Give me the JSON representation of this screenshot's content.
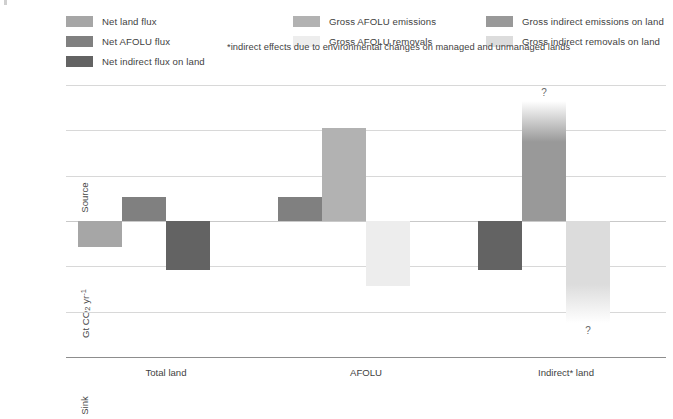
{
  "legend": {
    "items": [
      {
        "label": "Net land flux",
        "color": "#a6a6a6",
        "col": 0,
        "row": 0
      },
      {
        "label": "Net AFOLU flux",
        "color": "#808080",
        "col": 0,
        "row": 1
      },
      {
        "label": "Net indirect flux on land",
        "color": "#636363",
        "col": 0,
        "row": 2
      },
      {
        "label": "Gross AFOLU emissions",
        "color": "#b2b2b2",
        "col": 1,
        "row": 0
      },
      {
        "label": "Gross AFOLU removals",
        "color": "#ededed",
        "col": 1,
        "row": 1
      },
      {
        "label": "Gross indirect emissions on land",
        "color": "#999999",
        "col": 2,
        "row": 0
      },
      {
        "label": "Gross indirect removals on land",
        "color": "#dcdcdc",
        "col": 2,
        "row": 1
      }
    ],
    "footnote": "*indirect effects due to environmental changes on managed and unmanaged lands"
  },
  "axis": {
    "source_label": "Source",
    "sink_label": "Sink",
    "y_title_prefix": "Gt CO",
    "y_title_sub": "2",
    "y_title_mid": " yr",
    "y_title_sup": "-1",
    "tick_labels": [
      "30",
      "20",
      "10",
      "0",
      "–10",
      "–20",
      "–30"
    ],
    "tick_values": [
      30,
      20,
      10,
      0,
      -10,
      -20,
      -30
    ]
  },
  "chart_data": {
    "type": "bar",
    "title": "",
    "xlabel": "",
    "ylabel": "Gt CO2 yr-1",
    "ylim": [
      -30,
      30
    ],
    "grid": true,
    "legend_position": "top",
    "categories": [
      "Total land",
      "AFOLU",
      "Indirect* land"
    ],
    "series": [
      {
        "name": "Net land flux",
        "color": "#a6a6a6",
        "values": [
          -5.8,
          null,
          null
        ]
      },
      {
        "name": "Net AFOLU flux",
        "color": "#808080",
        "values": [
          5.3,
          5.3,
          null
        ]
      },
      {
        "name": "Net indirect flux on land",
        "color": "#636363",
        "values": [
          -10.7,
          null,
          -10.7
        ]
      },
      {
        "name": "Gross AFOLU emissions",
        "color": "#b2b2b2",
        "values": [
          null,
          20.5,
          null
        ]
      },
      {
        "name": "Gross AFOLU removals",
        "color": "#ededed",
        "values": [
          null,
          -14.4,
          null
        ]
      },
      {
        "name": "Gross indirect emissions on land",
        "color": "#999999",
        "values": [
          null,
          null,
          26.5
        ]
      },
      {
        "name": "Gross indirect removals on land",
        "color": "#dcdcdc",
        "values": [
          null,
          null,
          -22.5
        ]
      }
    ],
    "annotations": [
      {
        "text": "?",
        "series": "Gross indirect emissions on land",
        "category": "Indirect* land",
        "position": "above"
      },
      {
        "text": "?",
        "series": "Gross indirect removals on land",
        "category": "Indirect* land",
        "position": "below"
      }
    ],
    "bars": [
      {
        "name": "total-land-net-land-flux",
        "series": 0,
        "group": 0,
        "slot": 0,
        "value": -5.8,
        "fade": "none"
      },
      {
        "name": "total-land-net-afolu-flux",
        "series": 1,
        "group": 0,
        "slot": 1,
        "value": 5.3,
        "fade": "none"
      },
      {
        "name": "total-land-net-indirect-flux",
        "series": 2,
        "group": 0,
        "slot": 2,
        "value": -10.7,
        "fade": "none"
      },
      {
        "name": "afolu-net-afolu-flux",
        "series": 1,
        "group": 1,
        "slot": 0,
        "value": 5.3,
        "fade": "none"
      },
      {
        "name": "afolu-gross-emissions",
        "series": 3,
        "group": 1,
        "slot": 1,
        "value": 20.5,
        "fade": "none"
      },
      {
        "name": "afolu-gross-removals",
        "series": 4,
        "group": 1,
        "slot": 2,
        "value": -14.4,
        "fade": "none"
      },
      {
        "name": "indirect-land-net-indirect-flux",
        "series": 2,
        "group": 2,
        "slot": 0,
        "value": -10.7,
        "fade": "none"
      },
      {
        "name": "indirect-land-gross-indirect-emissions",
        "series": 5,
        "group": 2,
        "slot": 1,
        "value": 26.5,
        "fade": "top",
        "qmark": "?"
      },
      {
        "name": "indirect-land-gross-indirect-removals",
        "series": 6,
        "group": 2,
        "slot": 2,
        "value": -22.5,
        "fade": "bottom",
        "qmark": "?"
      }
    ]
  }
}
